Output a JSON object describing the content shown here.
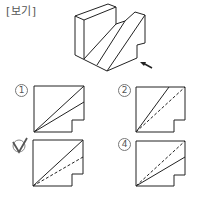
{
  "header": {
    "label": "[보기]"
  },
  "figure": {
    "arrow_icon": "view-direction-arrow"
  },
  "options": [
    {
      "number": "1",
      "marker": "①",
      "checked": false,
      "solid_line": "to-top-right-corner",
      "second_line": "solid-to-right-edge"
    },
    {
      "number": "2",
      "marker": "②",
      "checked": false,
      "solid_line": "to-top-edge",
      "second_line": "dashed-to-top-right-corner"
    },
    {
      "number": "3",
      "marker": "③",
      "checked": true,
      "solid_line": "to-top-right-corner",
      "second_line": "dashed-to-right-edge"
    },
    {
      "number": "4",
      "marker": "④",
      "checked": false,
      "solid_line": "to-right-edge",
      "second_line": "dashed-to-top-right-corner"
    }
  ],
  "colors": {
    "line": "#222222",
    "marker": "#777777",
    "check": "#555555"
  }
}
